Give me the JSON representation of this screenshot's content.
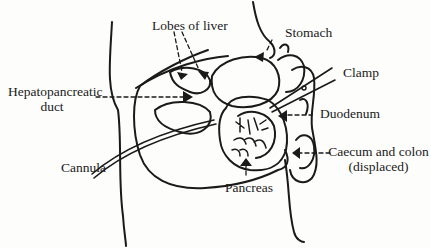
{
  "figure": {
    "type": "anatomical-diagram",
    "labels": {
      "lobes_of_liver": "Lobes of liver",
      "stomach": "Stomach",
      "clamp": "Clamp",
      "hepatopancreatic_duct_line1": "Hepatopancreatic",
      "hepatopancreatic_duct_line2": "duct",
      "duodenum": "Duodenum",
      "cannula": "Cannula",
      "pancreas": "Pancreas",
      "caecum_colon_line1": "Caecum and colon",
      "caecum_colon_line2": "(displaced)"
    },
    "colors": {
      "ink": "#1a1a1a",
      "paper": "#fdfdfc"
    }
  }
}
